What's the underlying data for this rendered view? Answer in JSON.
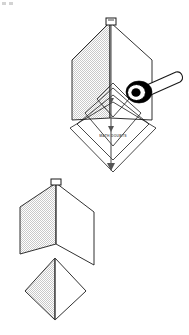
{
  "figure": {
    "watermark": "MATH DOUBTS",
    "corner_marks_label": "page-corner-marks",
    "colors": {
      "stroke": "#1a1a1a",
      "shade_fill": "#d8d8d8",
      "plain_fill": "#ffffff",
      "pin_body": "#000000",
      "pin_ring": "#ffffff",
      "background": "#ffffff"
    },
    "parts": [
      {
        "id": "upper-assembly",
        "label": "Upper folded hexagonal sheet with nested chevrons",
        "elements": [
          {
            "id": "left-shaded-panel",
            "label": "Left shaded panel",
            "fill": "shade"
          },
          {
            "id": "right-plain-panel",
            "label": "Right plain panel",
            "fill": "plain"
          },
          {
            "id": "center-fold-line",
            "label": "Vertical centre fold line"
          },
          {
            "id": "apex-clip",
            "label": "Apex paper clip"
          },
          {
            "id": "outer-diamond",
            "label": "Outer diamond outline"
          },
          {
            "id": "middle-diamond",
            "label": "Middle diamond outline"
          },
          {
            "id": "inner-diamond",
            "label": "Inner diamond outline"
          },
          {
            "id": "small-diamond",
            "label": "Smallest diamond outline"
          }
        ]
      },
      {
        "id": "pin-tool",
        "label": "Push pin pivot with handle",
        "elements": [
          {
            "id": "pin-handle",
            "label": "Pin handle shaft"
          },
          {
            "id": "pin-head",
            "label": "Pin head black disc"
          },
          {
            "id": "pin-ring",
            "label": "Pin head white ring"
          },
          {
            "id": "pin-centre",
            "label": "Pin centre black dot"
          }
        ]
      },
      {
        "id": "lower-chevron",
        "label": "Lower folded chevron sheet",
        "elements": [
          {
            "id": "lower-left-shaded-panel",
            "label": "Lower left shaded panel",
            "fill": "shade"
          },
          {
            "id": "lower-right-plain-panel",
            "label": "Lower right plain panel",
            "fill": "plain"
          },
          {
            "id": "lower-center-fold-line",
            "label": "Lower vertical centre fold line"
          },
          {
            "id": "lower-apex-clip",
            "label": "Lower apex paper clip"
          }
        ]
      },
      {
        "id": "bottom-diamond",
        "label": "Bottom folded diamond",
        "elements": [
          {
            "id": "bottom-left-shaded-half",
            "label": "Bottom diamond left shaded half",
            "fill": "shade"
          },
          {
            "id": "bottom-right-plain-half",
            "label": "Bottom diamond right plain half",
            "fill": "plain"
          },
          {
            "id": "bottom-center-fold-line",
            "label": "Bottom diamond vertical fold line"
          }
        ]
      }
    ]
  }
}
